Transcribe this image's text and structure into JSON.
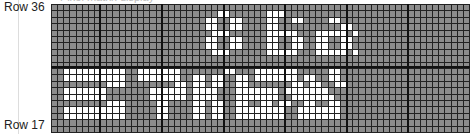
{
  "header": {
    "cut_title": "Pixel matrix display"
  },
  "labels": {
    "top_row": "Row 36",
    "bottom_row": "Row 17"
  },
  "grid": {
    "cols": 68,
    "rows": 20,
    "cell_off_color": "#8c8c8c",
    "cell_on_color": "#ffffff",
    "heavy_divider_cols": [
      8,
      18,
      28,
      38,
      48,
      58
    ],
    "lit_rows": [
      "....................................................................",
      "...........................##......###...........................",
      ".........................##..##....##..##....##...................",
      ".........................##..##....##..........##.................",
      "..........................###......#####...#####.#................",
      ".........................##..##....##..##..##..##.................",
      ".........................##..##....##..##..##..##.................",
      "..........................###......#####...#####.#................",
      "....................................................................",
      "....................................................................",
      "..##########..#######.......##...#######.....##.......",
      "..##########..#######..##.##..##.#######.##..##.......",
      ".........###........##.##.##..##.......##.##..##.......",
      "..#######.......######.####...#######.#######.......",
      "..#######.......######.####...#######..#######.......",
      ".........###.....##....##.##..##..##.##..##..##.......",
      "..##########.....##....##.##..########..#######.......",
      "..##########.....##....##.##..########..#######.......",
      "....................................................................",
      "...................................................................."
    ]
  }
}
